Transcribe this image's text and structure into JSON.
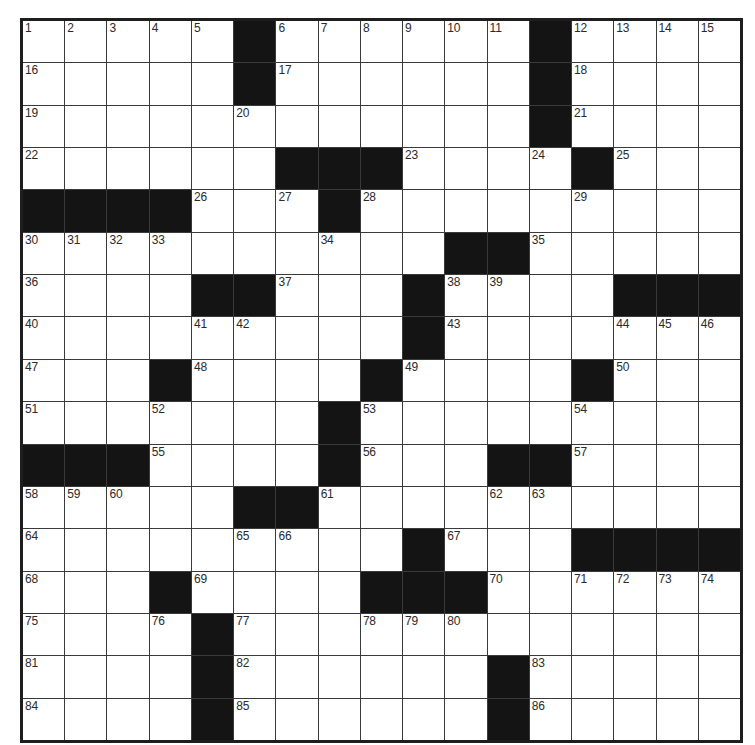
{
  "puzzle": {
    "rows": 17,
    "cols": 17,
    "colors": {
      "black_cell": "#141414",
      "white_cell": "#ffffff",
      "border": "#1e1e1e",
      "grid_line": "#3a3a3a",
      "number_text": "#2a2a2a"
    },
    "layout": [
      ".....#......#....",
      ".....#......#....",
      "............#....",
      "......###....#...",
      "####...#.........",
      "..........##.....",
      "....##...#....###",
      ".........#.......",
      "...#....#....#...",
      ".......#.........",
      "###....#...##....",
      ".....##..........",
      ".........#...####",
      "...#....###......",
      "....#............",
      "....#......#.....",
      "....#......#....."
    ],
    "numbers": {
      "0,0": "1",
      "0,1": "2",
      "0,2": "3",
      "0,3": "4",
      "0,4": "5",
      "0,6": "6",
      "0,7": "7",
      "0,8": "8",
      "0,9": "9",
      "0,10": "10",
      "0,11": "11",
      "0,13": "12",
      "0,14": "13",
      "0,15": "14",
      "0,16": "15",
      "1,0": "16",
      "1,6": "17",
      "1,13": "18",
      "2,0": "19",
      "2,5": "20",
      "2,13": "21",
      "3,0": "22",
      "3,9": "23",
      "3,12": "24",
      "3,14": "25",
      "4,4": "26",
      "4,6": "27",
      "4,8": "28",
      "4,13": "29",
      "5,0": "30",
      "5,1": "31",
      "5,2": "32",
      "5,3": "33",
      "5,7": "34",
      "5,12": "35",
      "6,0": "36",
      "6,6": "37",
      "6,10": "38",
      "6,11": "39",
      "7,0": "40",
      "7,4": "41",
      "7,5": "42",
      "7,10": "43",
      "7,14": "44",
      "7,15": "45",
      "7,16": "46",
      "8,0": "47",
      "8,4": "48",
      "8,9": "49",
      "8,14": "50",
      "9,0": "51",
      "9,3": "52",
      "9,8": "53",
      "9,13": "54",
      "10,3": "55",
      "10,8": "56",
      "10,13": "57",
      "11,0": "58",
      "11,1": "59",
      "11,2": "60",
      "11,7": "61",
      "11,11": "62",
      "11,12": "63",
      "12,0": "64",
      "12,5": "65",
      "12,6": "66",
      "12,10": "67",
      "13,0": "68",
      "13,4": "69",
      "13,11": "70",
      "13,13": "71",
      "13,14": "72",
      "13,15": "73",
      "13,16": "74",
      "14,0": "75",
      "14,3": "76",
      "14,5": "77",
      "14,8": "78",
      "14,9": "79",
      "14,10": "80",
      "15,0": "81",
      "15,5": "82",
      "15,12": "83",
      "16,0": "84",
      "16,5": "85",
      "16,12": "86"
    },
    "entries": {}
  }
}
